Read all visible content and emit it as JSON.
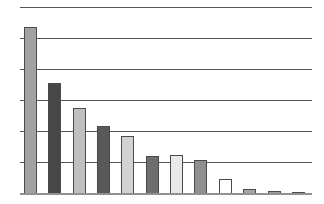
{
  "chart_data": {
    "type": "bar",
    "title": "",
    "xlabel": "",
    "ylabel": "",
    "categories": [
      "",
      "",
      "",
      "",
      "",
      "",
      "",
      "",
      "",
      "",
      "",
      ""
    ],
    "values": [
      5.35,
      3.55,
      2.74,
      2.16,
      1.84,
      1.19,
      1.23,
      1.06,
      0.45,
      0.13,
      0.08,
      0.04
    ],
    "ylim": [
      0,
      6
    ],
    "gridline_count": 7,
    "grid": true,
    "legend": "none",
    "axis_tick_labels_visible": false,
    "bar_colors": [
      "#a2a2a2",
      "#474747",
      "#bfbfbf",
      "#595959",
      "#d2d2d2",
      "#6e6e6e",
      "#e9e9e9",
      "#8f8f8f",
      "#ffffff",
      "#a6a6a6",
      "#9e9e9e",
      "#404040"
    ],
    "bar_border_color": "#4a4a4a",
    "gridline_color": "#555555",
    "axis_line_color": "#919191",
    "background": "#ffffff"
  }
}
